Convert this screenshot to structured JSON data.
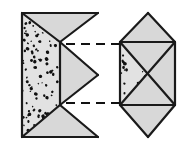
{
  "figure": {
    "background_color": "#ffffff",
    "stroke_color": "#1a1a1a",
    "fill_color": "#d8d8d8",
    "fill_color_light": "#e2e2e2",
    "stipple_color": "#111111",
    "dash_color": "#111111",
    "stroke_width": 2.2,
    "canvas": {
      "width": 195,
      "height": 153
    }
  },
  "left_shape": {
    "name": "left-half-crystal",
    "label": "",
    "outline_points": "22,13 98,13 60,42 98,75 60,105 98,137 22,137",
    "faces": [
      {
        "name": "stippled-face",
        "points": "22,13 60,42 60,105 22,137",
        "fill": "#e2e2e2",
        "stipple": true
      },
      {
        "name": "upper-triangle-face",
        "points": "22,13 98,13 60,42",
        "fill": "#d8d8d8",
        "stipple": false
      },
      {
        "name": "middle-wedge-face",
        "points": "60,42 98,75 60,105",
        "fill": "#d8d8d8",
        "stipple": false
      },
      {
        "name": "lower-triangle-face",
        "points": "22,137 98,137 60,105",
        "fill": "#d8d8d8",
        "stipple": false
      }
    ],
    "edges": [
      {
        "name": "left-vertical-edge",
        "x1": 22,
        "y1": 13,
        "x2": 22,
        "y2": 137
      },
      {
        "name": "top-horizontal-edge",
        "x1": 22,
        "y1": 13,
        "x2": 98,
        "y2": 13
      },
      {
        "name": "bottom-horizontal-edge",
        "x1": 22,
        "y1": 137,
        "x2": 98,
        "y2": 137
      },
      {
        "name": "upper-left-diagonal",
        "x1": 22,
        "y1": 13,
        "x2": 60,
        "y2": 42
      },
      {
        "name": "lower-left-diagonal",
        "x1": 22,
        "y1": 137,
        "x2": 60,
        "y2": 105
      },
      {
        "name": "inner-vertical-edge",
        "x1": 60,
        "y1": 42,
        "x2": 60,
        "y2": 105
      },
      {
        "name": "upper-right-diagonal",
        "x1": 98,
        "y1": 13,
        "x2": 60,
        "y2": 42
      },
      {
        "name": "notch-upper-diagonal",
        "x1": 60,
        "y1": 42,
        "x2": 98,
        "y2": 75
      },
      {
        "name": "notch-lower-diagonal",
        "x1": 98,
        "y1": 75,
        "x2": 60,
        "y2": 105
      },
      {
        "name": "lower-right-diagonal",
        "x1": 60,
        "y1": 105,
        "x2": 98,
        "y2": 137
      }
    ]
  },
  "right_shape": {
    "name": "right-bipyramid-crystal",
    "label": "",
    "outline_points": "148,13 175,42 175,105 148,137 120,105 120,42",
    "faces": [
      {
        "name": "top-pyramid-left-face",
        "points": "120,42 148,13 148,42",
        "fill": "#d8d8d8",
        "stipple": false
      },
      {
        "name": "top-pyramid-right-face",
        "points": "148,13 175,42 148,42",
        "fill": "#d8d8d8",
        "stipple": false
      },
      {
        "name": "prism-left-stippled-face",
        "points": "120,42 148,74 120,105",
        "fill": "#e2e2e2",
        "stipple": true
      },
      {
        "name": "prism-top-face",
        "points": "120,42 175,42 148,74",
        "fill": "#d8d8d8",
        "stipple": false
      },
      {
        "name": "prism-right-face",
        "points": "175,42 175,105 148,74",
        "fill": "#d8d8d8",
        "stipple": false
      },
      {
        "name": "prism-bottom-face",
        "points": "120,105 148,74 175,105",
        "fill": "#d8d8d8",
        "stipple": false
      },
      {
        "name": "bottom-pyramid-left-face",
        "points": "120,105 148,105 148,137",
        "fill": "#d8d8d8",
        "stipple": false
      },
      {
        "name": "bottom-pyramid-right-face",
        "points": "148,105 175,105 148,137",
        "fill": "#d8d8d8",
        "stipple": false
      }
    ],
    "edges": [
      {
        "name": "top-left-apex-edge",
        "x1": 148,
        "y1": 13,
        "x2": 120,
        "y2": 42
      },
      {
        "name": "top-right-apex-edge",
        "x1": 148,
        "y1": 13,
        "x2": 175,
        "y2": 42
      },
      {
        "name": "prism-top-horizontal-edge",
        "x1": 120,
        "y1": 42,
        "x2": 175,
        "y2": 42
      },
      {
        "name": "prism-left-vertical-edge",
        "x1": 120,
        "y1": 42,
        "x2": 120,
        "y2": 105
      },
      {
        "name": "prism-right-vertical-edge",
        "x1": 175,
        "y1": 42,
        "x2": 175,
        "y2": 105
      },
      {
        "name": "prism-bottom-horizontal-edge",
        "x1": 120,
        "y1": 105,
        "x2": 175,
        "y2": 105
      },
      {
        "name": "cross-diagonal-down",
        "x1": 120,
        "y1": 42,
        "x2": 175,
        "y2": 105
      },
      {
        "name": "cross-diagonal-up",
        "x1": 120,
        "y1": 105,
        "x2": 175,
        "y2": 42
      },
      {
        "name": "bottom-left-apex-edge",
        "x1": 120,
        "y1": 105,
        "x2": 148,
        "y2": 137
      },
      {
        "name": "bottom-right-apex-edge",
        "x1": 175,
        "y1": 105,
        "x2": 148,
        "y2": 137
      }
    ]
  },
  "connectors": [
    {
      "name": "upper-dashed-connector",
      "x1": 66,
      "y1": 44,
      "x2": 120,
      "y2": 44,
      "dash_pattern": "9 6"
    },
    {
      "name": "lower-dashed-connector",
      "x1": 66,
      "y1": 103,
      "x2": 120,
      "y2": 103,
      "dash_pattern": "9 6"
    }
  ],
  "stipple": {
    "left_face_dot_count": 150,
    "right_face_dot_count": 42,
    "dot_radius_min": 0.7,
    "dot_radius_max": 1.8
  }
}
